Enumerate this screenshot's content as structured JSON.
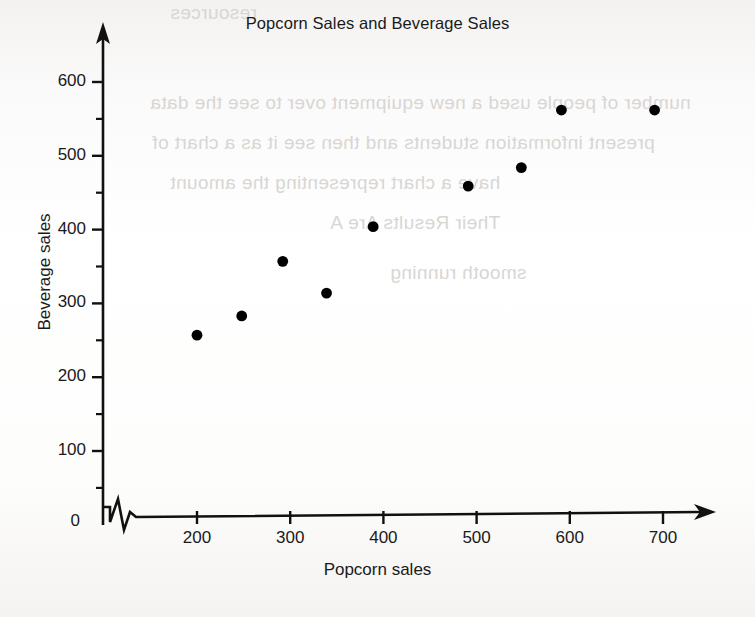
{
  "chart_data": {
    "type": "scatter",
    "title": "Popcorn Sales and Beverage Sales",
    "xlabel": "Popcorn sales",
    "ylabel": "Beverage sales",
    "xlim": [
      150,
      730
    ],
    "ylim": [
      0,
      650
    ],
    "x_ticks": [
      200,
      300,
      400,
      500,
      600,
      700
    ],
    "y_ticks": [
      0,
      100,
      200,
      300,
      400,
      500,
      600
    ],
    "y_minor_ticks": [
      50,
      150,
      250,
      350,
      450,
      550
    ],
    "grid": false,
    "legend": "none",
    "axis_break": "x-axis zigzag break between 0 and 200",
    "marker": "filled-circle",
    "marker_color": "#000000",
    "points": [
      {
        "x": 200,
        "y": 257
      },
      {
        "x": 248,
        "y": 283
      },
      {
        "x": 292,
        "y": 357
      },
      {
        "x": 339,
        "y": 314
      },
      {
        "x": 389,
        "y": 404
      },
      {
        "x": 491,
        "y": 459
      },
      {
        "x": 548,
        "y": 484
      },
      {
        "x": 591,
        "y": 562
      },
      {
        "x": 691,
        "y": 562
      }
    ]
  },
  "axes": {
    "x_tick_labels": [
      "200",
      "300",
      "400",
      "500",
      "600",
      "700"
    ],
    "y_tick_labels": [
      "0",
      "100",
      "200",
      "300",
      "400",
      "500",
      "600"
    ]
  },
  "scan_artifacts": {
    "bleed_lines": [
      "resources",
      "number of people used a new equipment over to see the data",
      "present information students and then see it as a chart of",
      "have a chart representing the amount",
      "Their Results Are A",
      "smooth running"
    ]
  }
}
